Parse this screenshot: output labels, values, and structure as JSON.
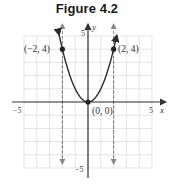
{
  "title": "Figure 4.2",
  "chart_data": {
    "type": "line",
    "title": "Figure 4.2",
    "xlabel": "x",
    "ylabel": "y",
    "xlim": [
      -5,
      5
    ],
    "ylim": [
      -5,
      5
    ],
    "grid": true,
    "x_ticks_labeled": [
      "-5",
      "5"
    ],
    "y_ticks_labeled": [
      "5",
      "-5"
    ],
    "series": [
      {
        "name": "y = x^2",
        "x": [
          -2.2,
          -2,
          -1.5,
          -1,
          -0.5,
          0,
          0.5,
          1,
          1.5,
          2,
          2.2
        ],
        "y": [
          4.84,
          4,
          2.25,
          1,
          0.25,
          0,
          0.25,
          1,
          2.25,
          4,
          4.84
        ]
      }
    ],
    "points": [
      {
        "x": -2,
        "y": 4,
        "label": "(−2, 4)"
      },
      {
        "x": 0,
        "y": 0,
        "label": "(0, 0)"
      },
      {
        "x": 2,
        "y": 4,
        "label": "(2, 4)"
      }
    ],
    "vertical_dashed_lines": [
      -2,
      2
    ],
    "annotations": [
      "(−2, 4)",
      "(0, 0)",
      "(2, 4)"
    ]
  },
  "labels": {
    "x_neg5": "−5",
    "x_pos5": "5",
    "y_pos5": "5",
    "y_neg5": "−5",
    "x_axis": "x",
    "y_axis": "y",
    "pt_left": "(−2, 4)",
    "pt_origin": "(0, 0)",
    "pt_right": "(2, 4)"
  },
  "colors": {
    "grid": "#d8d8d8",
    "axis": "#333333",
    "curve": "#2a2a2a",
    "dashed": "#888888"
  }
}
